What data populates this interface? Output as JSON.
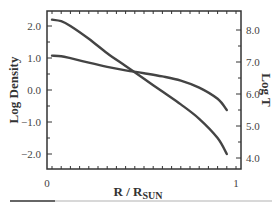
{
  "chart_data": {
    "type": "line",
    "title": "",
    "xlabel": "R / R",
    "xlabel_subscript": "SUN",
    "ylabel": "Log Density",
    "y2label": "Log T",
    "xlim": [
      0,
      1
    ],
    "ylim": [
      -2.5,
      2.5
    ],
    "y2lim": [
      3.6,
      8.5
    ],
    "x_tick_labels": [
      "0",
      "1"
    ],
    "y_tick_labels": [
      "2.0",
      "1.0",
      "0.0",
      "−1.0",
      "−2.0"
    ],
    "y2_tick_labels": [
      "8.0",
      "7.0",
      "6.0",
      "5.0",
      "4.0"
    ],
    "grid": false,
    "legend": null,
    "series": [
      {
        "name": "Log Density",
        "axis": "left",
        "x": [
          0.0,
          0.05,
          0.1,
          0.2,
          0.3,
          0.4,
          0.5,
          0.6,
          0.7,
          0.8,
          0.9,
          0.95
        ],
        "values": [
          2.2,
          2.15,
          2.0,
          1.6,
          1.15,
          0.75,
          0.35,
          -0.05,
          -0.45,
          -0.9,
          -1.5,
          -2.0
        ]
      },
      {
        "name": "Log T",
        "axis": "right",
        "x": [
          0.0,
          0.05,
          0.1,
          0.2,
          0.3,
          0.4,
          0.5,
          0.6,
          0.7,
          0.8,
          0.9,
          0.95
        ],
        "values": [
          7.2,
          7.18,
          7.12,
          6.98,
          6.85,
          6.74,
          6.65,
          6.55,
          6.42,
          6.2,
          5.85,
          5.5
        ]
      }
    ]
  },
  "progress": {
    "percent": 17
  }
}
